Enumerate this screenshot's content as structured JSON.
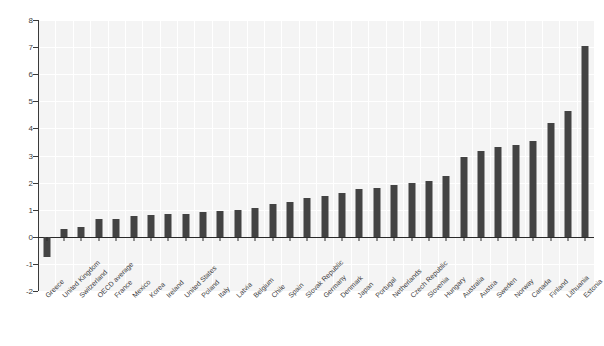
{
  "chart_data": {
    "type": "bar",
    "title": "",
    "subtitle": "",
    "xlabel": "",
    "ylabel": "",
    "ylim": [
      -2,
      8
    ],
    "yticks": [
      -2,
      -1,
      0,
      1,
      2,
      3,
      4,
      5,
      6,
      7,
      8
    ],
    "ytick_labels": [
      "-2",
      "-1",
      "0",
      "1",
      "2",
      "3",
      "4",
      "5",
      "6",
      "7",
      "8"
    ],
    "grid": true,
    "legend": false,
    "bar_color": "#434343",
    "plot_background": "#f4f4f4",
    "categories": [
      "Greece",
      "United Kingdom",
      "Switzerland",
      "OECD average",
      "France",
      "Mexico",
      "Korea",
      "Ireland",
      "United States",
      "Poland",
      "Italy",
      "Latvia",
      "Belgium",
      "Chile",
      "Spain",
      "Slovak Republic",
      "Germany",
      "Denmark",
      "Japan",
      "Portugal",
      "Netherlands",
      "Czech Republic",
      "Slovenia",
      "Hungary",
      "Australia",
      "Austria",
      "Sweden",
      "Norway",
      "Canada",
      "Finland",
      "Lithuania",
      "Estonia"
    ],
    "values": [
      -0.75,
      0.3,
      0.35,
      0.65,
      0.65,
      0.75,
      0.8,
      0.85,
      0.85,
      0.9,
      0.95,
      1.0,
      1.05,
      1.2,
      1.3,
      1.45,
      1.5,
      1.6,
      1.75,
      1.8,
      1.9,
      2.0,
      2.05,
      2.25,
      2.95,
      3.15,
      3.3,
      3.4,
      3.55,
      4.2,
      4.65,
      7.05
    ]
  }
}
